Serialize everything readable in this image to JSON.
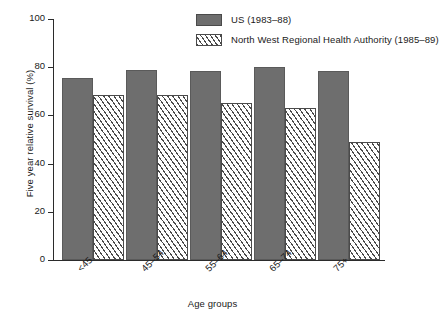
{
  "chart_data": {
    "type": "bar",
    "title": "",
    "xlabel": "Age groups",
    "ylabel": "Five year relative survival (%)",
    "ylim": [
      0,
      100
    ],
    "yticks": [
      0,
      20,
      40,
      60,
      80,
      100
    ],
    "grid": false,
    "legend_position": "top-right",
    "categories": [
      "<45",
      "45–54",
      "55–64",
      "65–74",
      "75+"
    ],
    "series": [
      {
        "name": "US (1983–88)",
        "swatch": "solid-gray-swatch",
        "color": "#6e6e6e",
        "values": [
          75.5,
          79,
          78.5,
          80,
          78.5
        ]
      },
      {
        "name": "North West Regional Health Authority (1985–89)",
        "swatch": "hatched-swatch",
        "color": "#ffffff",
        "values": [
          68.5,
          68.5,
          65,
          63,
          49
        ]
      }
    ]
  }
}
